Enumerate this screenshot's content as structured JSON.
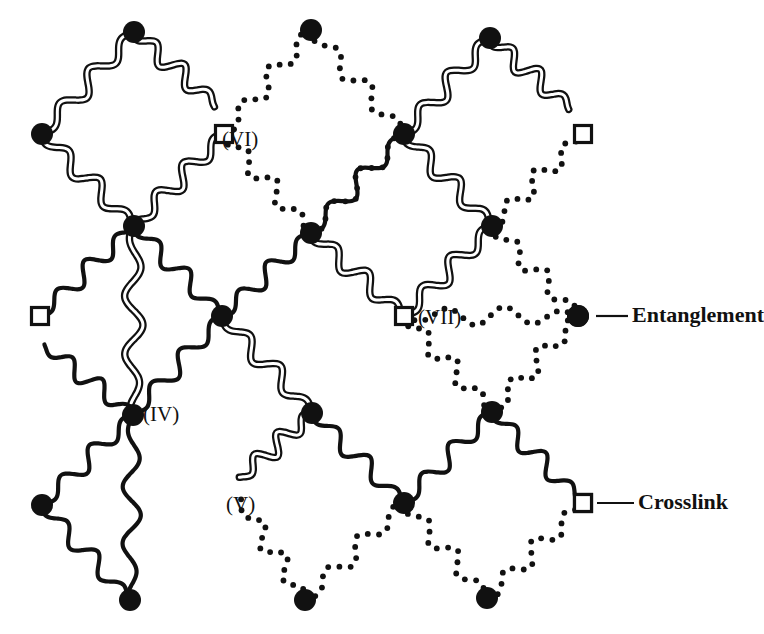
{
  "figure": {
    "kind": "polymer-network-schematic",
    "width": 764,
    "height": 634,
    "background": "#ffffff",
    "ink": "#111111"
  },
  "legend": {
    "items": [
      {
        "id": "entanglement",
        "label": "Entanglement",
        "marker": "filled-circle",
        "marker_color": "#111111",
        "marker_x": 578,
        "marker_y": 316,
        "leader_x1": 596,
        "leader_x2": 628,
        "text_x": 632,
        "text_y": 316
      },
      {
        "id": "crosslink",
        "label": "Crosslink",
        "marker": "open-square",
        "marker_color": "#111111",
        "marker_x": 583,
        "marker_y": 503,
        "leader_x1": 597,
        "leader_x2": 634,
        "text_x": 638,
        "text_y": 503
      }
    ]
  },
  "annotations": [
    {
      "id": "label-vi",
      "text": "(VI)",
      "x": 222,
      "y": 140
    },
    {
      "id": "label-vii",
      "text": "(VII)",
      "x": 418,
      "y": 318
    },
    {
      "id": "label-iv",
      "text": "(IV)",
      "x": 143,
      "y": 415
    },
    {
      "id": "label-v",
      "text": "(V)",
      "x": 226,
      "y": 505
    }
  ],
  "network": {
    "description": "Diamond lattice of wavy polymer chains joined at entanglement nodes and crosslink squares.",
    "chain_styles": {
      "double": {
        "name": "double-line-chain",
        "stroke": "#111111",
        "outer_width": 7.5,
        "inner_width": 3.0,
        "inner_color": "#ffffff"
      },
      "single": {
        "name": "single-line-chain",
        "stroke": "#111111",
        "width": 4.2
      },
      "dotted": {
        "name": "dotted-chain",
        "stroke": "#111111",
        "dot_radius": 2.9,
        "dot_spacing": 11
      }
    },
    "nodes": [
      {
        "id": "n-a1",
        "type": "entanglement",
        "x": 134,
        "y": 32,
        "r": 11
      },
      {
        "id": "n-a2",
        "type": "entanglement",
        "x": 311,
        "y": 30,
        "r": 11
      },
      {
        "id": "n-a3",
        "type": "entanglement",
        "x": 490,
        "y": 38,
        "r": 11
      },
      {
        "id": "n-b1",
        "type": "entanglement",
        "x": 42,
        "y": 134,
        "r": 11
      },
      {
        "id": "n-b2",
        "type": "entanglement",
        "x": 404,
        "y": 134,
        "r": 11
      },
      {
        "id": "n-c1",
        "type": "entanglement",
        "x": 134,
        "y": 226,
        "r": 11
      },
      {
        "id": "n-c2",
        "type": "entanglement",
        "x": 311,
        "y": 233,
        "r": 11
      },
      {
        "id": "n-c3",
        "type": "entanglement",
        "x": 492,
        "y": 226,
        "r": 11
      },
      {
        "id": "n-d1",
        "type": "entanglement",
        "x": 222,
        "y": 316,
        "r": 11
      },
      {
        "id": "n-d2",
        "type": "entanglement",
        "x": 578,
        "y": 316,
        "r": 11
      },
      {
        "id": "n-e1",
        "type": "entanglement",
        "x": 133,
        "y": 415,
        "r": 11
      },
      {
        "id": "n-e2",
        "type": "entanglement",
        "x": 312,
        "y": 413,
        "r": 11
      },
      {
        "id": "n-e3",
        "type": "entanglement",
        "x": 492,
        "y": 412,
        "r": 11
      },
      {
        "id": "n-f1",
        "type": "entanglement",
        "x": 42,
        "y": 505,
        "r": 11
      },
      {
        "id": "n-f2",
        "type": "entanglement",
        "x": 404,
        "y": 503,
        "r": 11
      },
      {
        "id": "n-g1",
        "type": "entanglement",
        "x": 130,
        "y": 600,
        "r": 11
      },
      {
        "id": "n-g2",
        "type": "entanglement",
        "x": 305,
        "y": 600,
        "r": 11
      },
      {
        "id": "n-g3",
        "type": "entanglement",
        "x": 487,
        "y": 598,
        "r": 11
      }
    ],
    "crosslinks": [
      {
        "id": "x-top",
        "x": 224,
        "y": 134,
        "size": 17
      },
      {
        "id": "x-right",
        "x": 583,
        "y": 134,
        "size": 17
      },
      {
        "id": "x-left",
        "x": 40,
        "y": 316,
        "size": 17
      },
      {
        "id": "x-mid",
        "x": 404,
        "y": 316,
        "size": 17
      },
      {
        "id": "x-bottom",
        "x": 583,
        "y": 503,
        "size": 17
      }
    ],
    "chain_counts": {
      "double": 14,
      "single": 12,
      "dotted": 14
    }
  },
  "chart_data": {
    "type": "diagram",
    "legend_entries": [
      "Entanglement",
      "Crosslink"
    ],
    "region_labels": [
      "(IV)",
      "(V)",
      "(VI)",
      "(VII)"
    ],
    "node_count": 18,
    "crosslink_count": 5
  }
}
